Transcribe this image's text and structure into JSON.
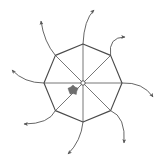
{
  "figure": {
    "title_fragment": "",
    "background_color": "#ffffff",
    "stroke_color": "#4a4a4a",
    "arrow_color": "#555555",
    "hub_fill": "#ffffff",
    "blob_color": "#6e6e6e",
    "width": 164,
    "height": 161,
    "center": {
      "x": 83,
      "y": 83
    },
    "polygon": {
      "name": "octagon",
      "sides": 8,
      "radius": 39,
      "rotation_deg": 22.5,
      "vertices": [
        {
          "label": "v1-top",
          "x": 83,
          "y": 44
        },
        {
          "label": "v2-top-right",
          "x": 110.6,
          "y": 55.4
        },
        {
          "label": "v3-right",
          "x": 122,
          "y": 83
        },
        {
          "label": "v4-bottom-right",
          "x": 110.6,
          "y": 110.6
        },
        {
          "label": "v5-bottom",
          "x": 83,
          "y": 122
        },
        {
          "label": "v6-bottom-left",
          "x": 55.4,
          "y": 110.6
        },
        {
          "label": "v7-left",
          "x": 44,
          "y": 83
        },
        {
          "label": "v8-top-left",
          "x": 55.4,
          "y": 55.4
        }
      ]
    },
    "hub": {
      "x": 83,
      "y": 83,
      "radius": 2.2
    },
    "blob": {
      "x": 73,
      "y": 90,
      "radius": 5
    },
    "spoke_count": 8,
    "arrows": [
      {
        "name": "arrow-north",
        "start": {
          "x": 83,
          "y": 44
        },
        "control": {
          "x": 84,
          "y": 20
        },
        "end": {
          "x": 94,
          "y": 10
        },
        "direction": "up-right"
      },
      {
        "name": "arrow-northeast",
        "start": {
          "x": 110.6,
          "y": 55.4
        },
        "control": {
          "x": 108,
          "y": 37
        },
        "end": {
          "x": 125,
          "y": 37
        },
        "direction": "right"
      },
      {
        "name": "arrow-east",
        "start": {
          "x": 122,
          "y": 83
        },
        "control": {
          "x": 143,
          "y": 82
        },
        "end": {
          "x": 153,
          "y": 97
        },
        "direction": "down-right"
      },
      {
        "name": "arrow-southeast",
        "start": {
          "x": 110.6,
          "y": 110.6
        },
        "control": {
          "x": 126,
          "y": 117
        },
        "end": {
          "x": 124,
          "y": 143
        },
        "direction": "down"
      },
      {
        "name": "arrow-south",
        "start": {
          "x": 83,
          "y": 122
        },
        "control": {
          "x": 81,
          "y": 141
        },
        "end": {
          "x": 68,
          "y": 154
        },
        "direction": "down-left"
      },
      {
        "name": "arrow-southwest",
        "start": {
          "x": 55.4,
          "y": 110.6
        },
        "control": {
          "x": 49,
          "y": 124
        },
        "end": {
          "x": 24,
          "y": 124
        },
        "direction": "left"
      },
      {
        "name": "arrow-west",
        "start": {
          "x": 44,
          "y": 83
        },
        "control": {
          "x": 24,
          "y": 83
        },
        "end": {
          "x": 12,
          "y": 70
        },
        "direction": "up-left"
      },
      {
        "name": "arrow-northwest",
        "start": {
          "x": 55.4,
          "y": 55.4
        },
        "control": {
          "x": 44,
          "y": 42
        },
        "end": {
          "x": 41,
          "y": 21
        },
        "direction": "up"
      }
    ]
  }
}
